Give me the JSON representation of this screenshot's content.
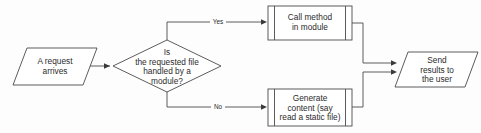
{
  "diagram": {
    "type": "flowchart",
    "background_color": "#fdfdfd",
    "stroke_color": "#4a4a4a",
    "text_color": "#2b2b2b",
    "nodes": [
      {
        "id": "request-arrives",
        "shape": "parallelogram",
        "role": "input",
        "lines": [
          "A request",
          "arrives"
        ]
      },
      {
        "id": "module-decision",
        "shape": "diamond",
        "role": "decision",
        "lines": [
          "Is",
          "the requested file",
          "handled by a",
          "module?"
        ]
      },
      {
        "id": "call-method",
        "shape": "predefined-process",
        "role": "process",
        "lines": [
          "Call method",
          "in module"
        ]
      },
      {
        "id": "generate-content",
        "shape": "predefined-process",
        "role": "process",
        "lines": [
          "Generate",
          "content (say",
          "read a static file)"
        ]
      },
      {
        "id": "send-results",
        "shape": "parallelogram",
        "role": "output",
        "lines": [
          "Send",
          "results to",
          "the user"
        ]
      }
    ],
    "edges": [
      {
        "id": "request-to-decision",
        "from": "request-arrives",
        "to": "module-decision",
        "label": ""
      },
      {
        "id": "decision-yes",
        "from": "module-decision",
        "to": "call-method",
        "label": "Yes"
      },
      {
        "id": "decision-no",
        "from": "module-decision",
        "to": "generate-content",
        "label": "No"
      },
      {
        "id": "call-to-send",
        "from": "call-method",
        "to": "send-results",
        "label": ""
      },
      {
        "id": "generate-to-send",
        "from": "generate-content",
        "to": "send-results",
        "label": ""
      }
    ]
  }
}
